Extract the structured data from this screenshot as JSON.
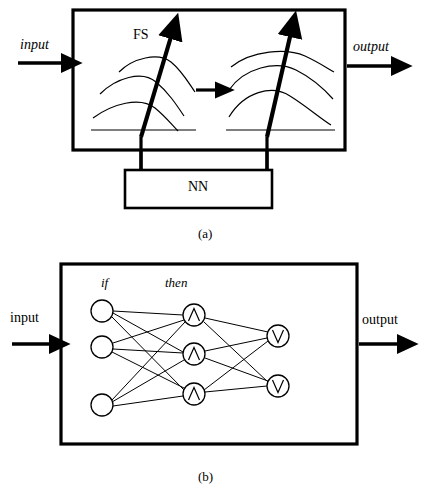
{
  "figure": {
    "panels": [
      {
        "id": "panel-a",
        "caption": "(a)",
        "input_label": "input",
        "output_label": "output",
        "fs_label": "FS",
        "nn_label": "NN",
        "box": {
          "x": 73,
          "y": 10,
          "width": 272,
          "height": 140
        },
        "nn_box": {
          "x": 125,
          "y": 170,
          "width": 147,
          "height": 38
        },
        "fuzzy_plots": [
          {
            "id": "fuzzy-plot-left",
            "x": 95,
            "y": 42,
            "width": 108,
            "height": 92,
            "curves": 3
          },
          {
            "id": "fuzzy-plot-right",
            "x": 228,
            "y": 42,
            "width": 108,
            "height": 92,
            "curves": 3
          }
        ],
        "transform_arrow": {
          "x1": 194,
          "y1": 90,
          "x2": 222,
          "y2": 90
        },
        "tuning_links": [
          {
            "id": "tuning-link-left",
            "x": 142,
            "y1": 108,
            "y2": 170
          },
          {
            "id": "tuning-link-right",
            "x": 268,
            "y1": 108,
            "y2": 170
          }
        ]
      },
      {
        "id": "panel-b",
        "caption": "(b)",
        "input_label": "input",
        "output_label": "output",
        "if_label": "if",
        "then_label": "then",
        "box": {
          "x": 61,
          "y": 264,
          "width": 296,
          "height": 180
        },
        "layers": [
          {
            "id": "layer-if",
            "name": "if",
            "glyph": "",
            "nodes": [
              {
                "id": "if-node-1",
                "cx": 102,
                "cy": 311,
                "r": 11,
                "glyph": ""
              },
              {
                "id": "if-node-2",
                "cx": 102,
                "cy": 347,
                "r": 11,
                "glyph": ""
              },
              {
                "id": "if-node-3",
                "cx": 102,
                "cy": 405,
                "r": 11,
                "glyph": ""
              }
            ]
          },
          {
            "id": "layer-then",
            "name": "then",
            "glyph": "∧",
            "nodes": [
              {
                "id": "then-node-1",
                "cx": 194,
                "cy": 315,
                "r": 11,
                "glyph": "∧"
              },
              {
                "id": "then-node-2",
                "cx": 194,
                "cy": 354,
                "r": 11,
                "glyph": "∧"
              },
              {
                "id": "then-node-3",
                "cx": 194,
                "cy": 394,
                "r": 11,
                "glyph": "∧"
              }
            ]
          },
          {
            "id": "layer-output",
            "name": "output",
            "glyph": "∨",
            "nodes": [
              {
                "id": "out-node-1",
                "cx": 278,
                "cy": 336,
                "r": 11,
                "glyph": "∨"
              },
              {
                "id": "out-node-2",
                "cx": 278,
                "cy": 386,
                "r": 11,
                "glyph": "∨"
              }
            ]
          }
        ],
        "edges_if_to_then": 9,
        "edges_then_to_output": 6
      }
    ],
    "colors": {
      "stroke": "#000000",
      "background": "#ffffff",
      "text": "#000000"
    }
  }
}
